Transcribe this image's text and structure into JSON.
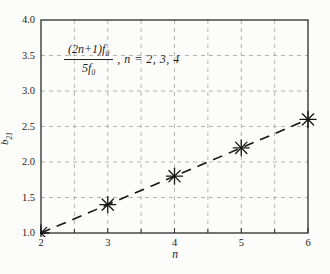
{
  "chart_data": {
    "type": "line",
    "title": "",
    "xlabel": "n",
    "ylabel": {
      "main": "b",
      "sub": "21"
    },
    "xlim": [
      2,
      6
    ],
    "ylim": [
      1.0,
      4.0
    ],
    "xticks": [
      2,
      3,
      4,
      5,
      6
    ],
    "xticklabels": [
      "2",
      "3",
      "4",
      "5",
      "6"
    ],
    "yticks": [
      1.0,
      1.5,
      2.0,
      2.5,
      3.0,
      3.5,
      4.0
    ],
    "yticklabels": [
      "1.0",
      "1.5",
      "2.0",
      "2.5",
      "3.0",
      "3.5",
      "4.0"
    ],
    "grid": {
      "on": true,
      "step": 0.5,
      "style": "dashed",
      "color": "#b4b4b2"
    },
    "legend": {
      "visible": false
    },
    "series": [
      {
        "name": "(2n+1)f0/5f0",
        "line_style": "dashed",
        "marker": "asterisk",
        "color": "#161616",
        "x": [
          2,
          3,
          4,
          5,
          6
        ],
        "y": [
          1.0,
          1.4,
          1.8,
          2.2,
          2.6
        ],
        "marker_points": [
          [
            2,
            1.0
          ],
          [
            3,
            1.4
          ],
          [
            4,
            1.8
          ],
          [
            5,
            2.2
          ],
          [
            6,
            2.6
          ]
        ]
      }
    ],
    "annotation": {
      "numerator_main": "(2n+1)f",
      "numerator_sub": "0",
      "denominator_main": "5f",
      "denominator_sub": "0",
      "suffix": ", n = 2, 3, 4"
    },
    "colors": {
      "frame": "#2b2b2b",
      "grid": "#b4b4b2",
      "data": "#161616",
      "background": "#fcfcfa"
    }
  }
}
